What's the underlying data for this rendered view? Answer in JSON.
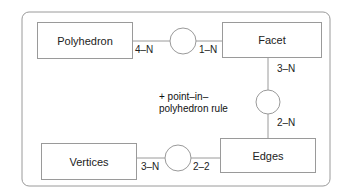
{
  "diagram": {
    "type": "entity-relationship",
    "entities": {
      "polyhedron": "Polyhedron",
      "facet": "Facet",
      "vertices": "Vertices",
      "edges": "Edges"
    },
    "relationships": [
      {
        "from": "Polyhedron",
        "to": "Facet",
        "from_cardinality": "4–N",
        "to_cardinality": "1–N"
      },
      {
        "from": "Facet",
        "to": "Edges",
        "from_cardinality": "3–N",
        "to_cardinality": "2–N"
      },
      {
        "from": "Vertices",
        "to": "Edges",
        "from_cardinality": "3–N",
        "to_cardinality": "2–2"
      }
    ],
    "cardinalities": {
      "poly_facet_left": "4–N",
      "poly_facet_right": "1–N",
      "facet_edges_top": "3–N",
      "facet_edges_bottom": "2–N",
      "vert_edges_left": "3–N",
      "vert_edges_right": "2–2"
    },
    "note_line1": "+ point–in–",
    "note_line2": "polyhedron rule",
    "colors": {
      "stroke": "#9a9a9a",
      "text": "#222222",
      "background": "#ffffff"
    }
  }
}
